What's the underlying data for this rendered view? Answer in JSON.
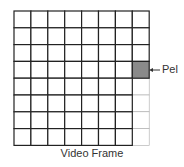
{
  "diagram": {
    "caption": "Video Frame",
    "pel_label": "Pel",
    "grid": {
      "rows": 8,
      "cols": 8
    },
    "highlighted_cell": {
      "row": 4,
      "col": 8,
      "color": "#8a8a8a"
    },
    "faded_cells_note": "column 8, rows 5-8 drawn with light lines",
    "line_color": "#222222",
    "faded_line_color": "#aaaaaa"
  }
}
